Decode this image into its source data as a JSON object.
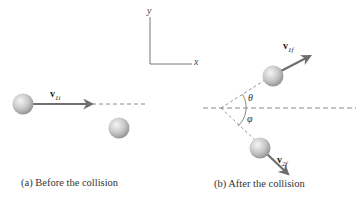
{
  "figure": {
    "axes": {
      "x_label": "x",
      "y_label": "y"
    },
    "panel_a": {
      "caption": "(a) Before the collision",
      "velocity_label": {
        "symbol": "v",
        "subscript": "1i"
      }
    },
    "panel_b": {
      "caption": "(b) After the collision",
      "velocity_1_label": {
        "symbol": "v",
        "subscript": "1f"
      },
      "velocity_2_label": {
        "symbol": "v",
        "subscript": "2f"
      },
      "angle_upper": "θ",
      "angle_lower": "φ"
    },
    "colors": {
      "arrow": "#6e6e6e",
      "dashed_line": "#8a8a8a",
      "ball_light": "#f2f2f2",
      "ball_dark": "#9a9a9a",
      "text": "#333333"
    }
  }
}
